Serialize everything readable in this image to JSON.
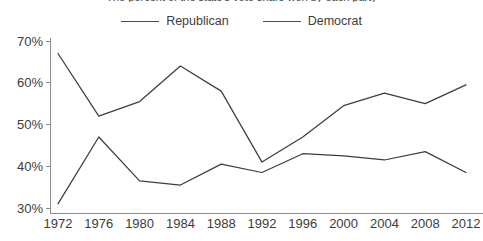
{
  "chart_data": {
    "type": "line",
    "title": "The percent of the state's vote share won by each party",
    "xlabel": "",
    "ylabel": "",
    "x": [
      1972,
      1976,
      1980,
      1984,
      1988,
      1992,
      1996,
      2000,
      2004,
      2008,
      2012
    ],
    "xticklabels": [
      "1972",
      "1976",
      "1980",
      "1984",
      "1988",
      "1992",
      "1996",
      "2000",
      "2004",
      "2008",
      "2012"
    ],
    "yticklabels": [
      "30%",
      "40%",
      "50%",
      "60%",
      "70%"
    ],
    "yticks": [
      30,
      40,
      50,
      60,
      70
    ],
    "ylim": [
      28.5,
      71
    ],
    "xlim": [
      1971.2,
      2013.2
    ],
    "grid": false,
    "legend_position": "top-center",
    "series": [
      {
        "name": "Republican",
        "color": "#3d3d3d",
        "values": [
          67,
          52,
          55.5,
          64,
          58,
          41,
          47,
          54.5,
          57.5,
          55,
          59.5
        ]
      },
      {
        "name": "Democrat",
        "color": "#3d3d3d",
        "values": [
          31,
          47,
          36.5,
          35.5,
          40.5,
          38.5,
          43,
          42.5,
          41.5,
          43.5,
          38.5
        ]
      }
    ]
  },
  "legend": {
    "items": [
      {
        "label": "Republican"
      },
      {
        "label": "Democrat"
      }
    ]
  }
}
